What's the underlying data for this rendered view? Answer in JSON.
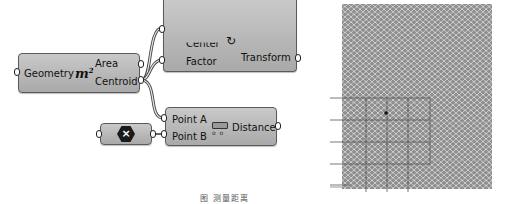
{
  "canvas": {
    "background": "#ffffff",
    "node_color": "#b9b9b9"
  },
  "area_node": {
    "input": "Geometry",
    "icon": "m²",
    "icon_base": "m",
    "icon_sup": "2",
    "outputs": [
      "Area",
      "Centroid"
    ]
  },
  "scale_node": {
    "inputs": [
      "Center",
      "Factor"
    ],
    "output": "Transform"
  },
  "point_param": {
    "icon": "×"
  },
  "distance_node": {
    "inputs": [
      "Point A",
      "Point B"
    ],
    "output": "Distance"
  },
  "viewport": {
    "description": "Hexagonal mesh pattern with grid overlay and centroid point"
  },
  "caption": "图    测量距离"
}
